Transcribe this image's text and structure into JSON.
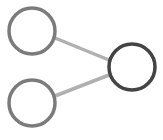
{
  "diagram": {
    "type": "node-graph",
    "colors": {
      "background": "#ffffff",
      "input_node_stroke": "#7b7b7b",
      "output_node_stroke": "#444444",
      "edge": "#b0b0b0"
    },
    "nodes": [
      {
        "id": "input-top",
        "cx": 32,
        "cy": 31,
        "r": 23
      },
      {
        "id": "input-bottom",
        "cx": 32,
        "cy": 103,
        "r": 23
      },
      {
        "id": "output",
        "cx": 132,
        "cy": 67,
        "r": 23
      }
    ],
    "edges": [
      {
        "from": "input-top",
        "to": "output",
        "x1": 55,
        "y1": 38,
        "x2": 109,
        "y2": 60
      },
      {
        "from": "input-bottom",
        "to": "output",
        "x1": 55,
        "y1": 96,
        "x2": 109,
        "y2": 75
      }
    ]
  }
}
